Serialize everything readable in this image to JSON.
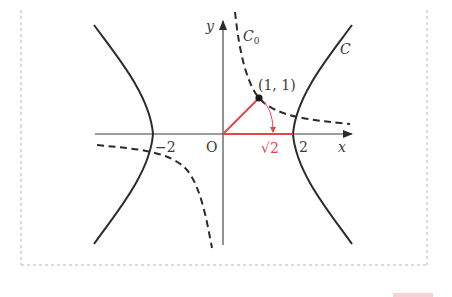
{
  "figure": {
    "type": "coordinate-diagram",
    "axes": {
      "x_label": "x",
      "y_label": "y",
      "origin_label": "O"
    },
    "ticks": {
      "neg_two": "−2",
      "two": "2",
      "sqrt_two": "√2"
    },
    "point": {
      "label": "(1, 1)",
      "x": 1,
      "y": 1
    },
    "curves": [
      {
        "name": "C",
        "label": "C",
        "equation": "x² − y² = 4",
        "style": "solid"
      },
      {
        "name": "C0",
        "label": "C",
        "subscript": "0",
        "equation": "y = 1/x",
        "style": "dashed"
      }
    ],
    "annotations": {
      "rotation_arc": "arrow from (1,1) rotating down to (√2, 0)",
      "segment_color": "#e8434b"
    },
    "colors": {
      "curve": "#2b2b2b",
      "axis": "#3a3a3a",
      "highlight": "#e8434b",
      "frame": "#b8b8b8"
    }
  }
}
